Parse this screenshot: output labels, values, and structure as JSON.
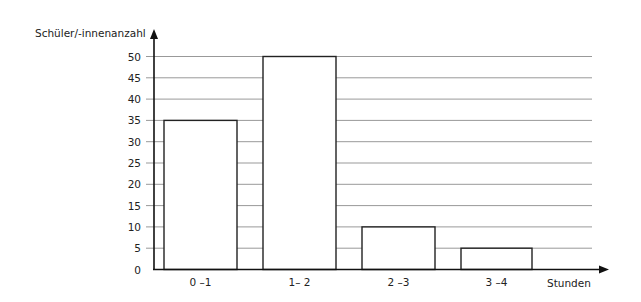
{
  "chart_data": {
    "type": "bar",
    "title": "",
    "xlabel": "Stunden",
    "ylabel": "Schüler/-innenanzahl",
    "categories": [
      "0 –1",
      "1– 2",
      "2 –3",
      "3 –4"
    ],
    "values": [
      35,
      50,
      10,
      5
    ],
    "ylim": [
      0,
      50
    ],
    "yticks": [
      0,
      5,
      10,
      15,
      20,
      25,
      30,
      35,
      40,
      45,
      50
    ],
    "grid": true,
    "legend": null,
    "colors": {
      "bar_fill": "#ffffff",
      "bar_stroke": "#222222",
      "grid": "#999999",
      "axis": "#111111"
    }
  }
}
